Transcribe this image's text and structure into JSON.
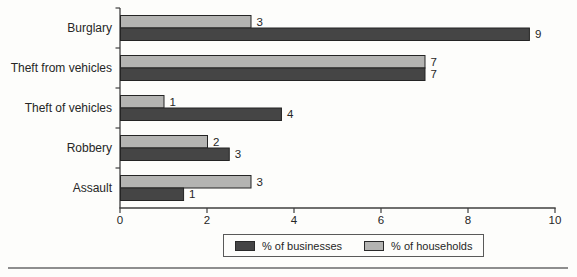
{
  "chart_data": {
    "type": "bar",
    "orientation": "horizontal",
    "title": "",
    "xlabel": "",
    "ylabel": "",
    "categories": [
      "Burglary",
      "Theft from vehicles",
      "Theft of vehicles",
      "Robbery",
      "Assault"
    ],
    "series": [
      {
        "name": "% of businesses",
        "color": "#454545",
        "values": [
          9,
          7,
          4,
          3,
          1
        ],
        "bar_lengths": [
          9.4,
          7.0,
          3.7,
          2.5,
          1.45
        ]
      },
      {
        "name": "% of households",
        "color": "#b4b4b2",
        "values": [
          3,
          7,
          1,
          2,
          3
        ],
        "bar_lengths": [
          3.0,
          7.0,
          1.0,
          2.0,
          3.0
        ]
      }
    ],
    "xlim": [
      0,
      10
    ],
    "xticks": [
      0,
      2,
      4,
      6,
      8,
      10
    ],
    "grid": false,
    "legend_position": "bottom-center",
    "value_labels_shown": true,
    "bar_order_in_group": [
      "% of households",
      "% of businesses"
    ]
  },
  "colors": {
    "background": "#fdfdfb",
    "axis": "#3f3f3f",
    "text": "#262626",
    "bar_border": "#242424",
    "legend_border": "#595959",
    "divider": "#8e8e8e"
  }
}
